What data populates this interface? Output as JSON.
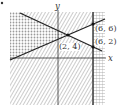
{
  "diagram": {
    "type": "system-of-linear-inequalities-graph",
    "axes": {
      "x_label": "x",
      "y_label": "y"
    },
    "points": [
      {
        "label": "(2, 4)",
        "x": 2,
        "y": 4
      },
      {
        "label": "(6, 6)",
        "x": 6,
        "y": 6
      },
      {
        "label": "(6, 2)",
        "x": 6,
        "y": 2
      }
    ],
    "lines": [
      {
        "name": "decreasing-line",
        "through": [
          "(2, 4)",
          "(6, 2)"
        ]
      },
      {
        "name": "increasing-line",
        "through": [
          "(2, 4)",
          "(6, 6)"
        ]
      },
      {
        "name": "vertical-line",
        "equation": "x = 6"
      }
    ],
    "regions": [
      {
        "name": "left-region",
        "pattern": "cross-hatch"
      },
      {
        "name": "main-region",
        "pattern": "diagonal-hatch"
      },
      {
        "name": "right-strip",
        "pattern": "cross-hatch"
      }
    ],
    "colors": {
      "line": "#222222",
      "hatch": "#9a9a9a",
      "background": "#ffffff"
    }
  }
}
